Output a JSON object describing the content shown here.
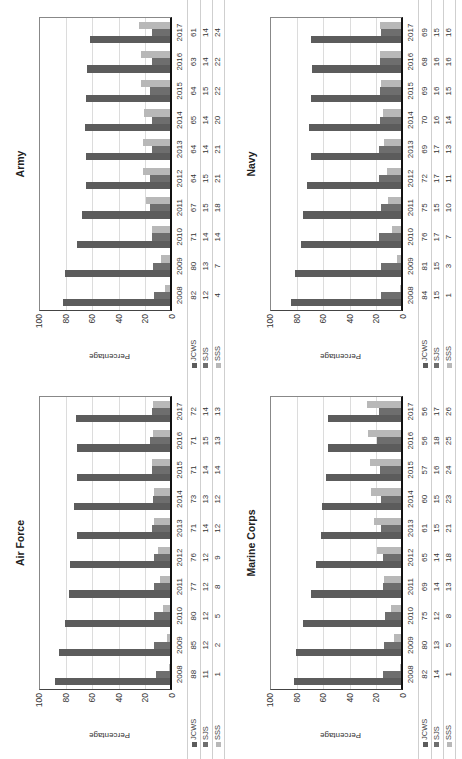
{
  "colors": {
    "JCWS": "#5c5c5c",
    "SJS": "#6e6e6e",
    "SSS": "#b8b8b8",
    "grid": "#dcdcdc"
  },
  "y_axis": {
    "label": "Percentage",
    "ticks": [
      "100",
      "80",
      "60",
      "40",
      "20",
      "0"
    ]
  },
  "legend": [
    "JCWS",
    "SJS",
    "SSS"
  ],
  "chart_data": [
    {
      "type": "bar",
      "title": "Air Force",
      "position": "bottom-left",
      "xlabel": "",
      "ylabel": "Percentage",
      "ylim": [
        0,
        100
      ],
      "grid": true,
      "legend_position": "table-left",
      "categories": [
        "2008",
        "2009",
        "2010",
        "2011",
        "2012",
        "2013",
        "2014",
        "2015",
        "2016",
        "2017"
      ],
      "series": [
        {
          "name": "JCWS",
          "values": [
            88,
            85,
            80,
            77,
            76,
            71,
            73,
            71,
            71,
            72
          ]
        },
        {
          "name": "SJS",
          "values": [
            11,
            12,
            12,
            12,
            12,
            14,
            13,
            14,
            15,
            14
          ]
        },
        {
          "name": "SSS",
          "values": [
            1,
            2,
            5,
            8,
            9,
            12,
            12,
            14,
            13,
            13
          ]
        }
      ]
    },
    {
      "type": "bar",
      "title": "Army",
      "position": "top-left",
      "xlabel": "",
      "ylabel": "Percentage",
      "ylim": [
        0,
        100
      ],
      "grid": true,
      "legend_position": "table-left",
      "categories": [
        "2008",
        "2009",
        "2010",
        "2011",
        "2012",
        "2013",
        "2014",
        "2015",
        "2016",
        "2017"
      ],
      "series": [
        {
          "name": "JCWS",
          "values": [
            82,
            80,
            71,
            67,
            64,
            64,
            65,
            64,
            63,
            61
          ]
        },
        {
          "name": "SJS",
          "values": [
            12,
            13,
            14,
            15,
            15,
            14,
            14,
            15,
            14,
            14
          ]
        },
        {
          "name": "SSS",
          "values": [
            4,
            7,
            14,
            18,
            21,
            21,
            20,
            22,
            22,
            24
          ]
        }
      ]
    },
    {
      "type": "bar",
      "title": "Marine Corps",
      "position": "bottom-right",
      "xlabel": "",
      "ylabel": "Percentage",
      "ylim": [
        0,
        100
      ],
      "grid": true,
      "legend_position": "table-left",
      "categories": [
        "2008",
        "2009",
        "2010",
        "2011",
        "2012",
        "2013",
        "2014",
        "2015",
        "2016",
        "2017"
      ],
      "series": [
        {
          "name": "JCWS",
          "values": [
            82,
            80,
            75,
            69,
            65,
            61,
            60,
            57,
            56,
            56
          ]
        },
        {
          "name": "SJS",
          "values": [
            14,
            13,
            12,
            14,
            14,
            15,
            15,
            16,
            18,
            17
          ]
        },
        {
          "name": "SSS",
          "values": [
            1,
            5,
            8,
            13,
            18,
            21,
            23,
            24,
            25,
            26
          ]
        }
      ]
    },
    {
      "type": "bar",
      "title": "Navy",
      "position": "top-right",
      "xlabel": "",
      "ylabel": "Percentage",
      "ylim": [
        0,
        100
      ],
      "grid": true,
      "legend_position": "table-left",
      "categories": [
        "2008",
        "2009",
        "2010",
        "2011",
        "2012",
        "2013",
        "2014",
        "2015",
        "2016",
        "2017"
      ],
      "series": [
        {
          "name": "JCWS",
          "values": [
            84,
            81,
            76,
            75,
            72,
            69,
            70,
            69,
            68,
            69
          ]
        },
        {
          "name": "SJS",
          "values": [
            15,
            15,
            17,
            15,
            17,
            17,
            16,
            16,
            16,
            15
          ]
        },
        {
          "name": "SSS",
          "values": [
            1,
            3,
            7,
            10,
            11,
            13,
            14,
            15,
            16,
            16
          ]
        }
      ]
    }
  ]
}
